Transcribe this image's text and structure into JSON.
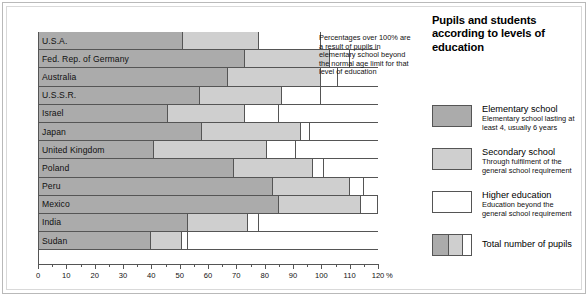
{
  "side": {
    "title": "Pupils and students according to levels of education",
    "legend": [
      {
        "name": "Elementary school",
        "desc": "Elementary school lasting at least 4, usually 6 years",
        "swatch": "elem",
        "color": "#ababab"
      },
      {
        "name": "Secondary school",
        "desc": "Through fulfilment of the general school requirement",
        "swatch": "sec",
        "color": "#cfcfcf"
      },
      {
        "name": "Higher education",
        "desc": "Education beyond the general school requirement",
        "swatch": "high",
        "color": "#ffffff"
      },
      {
        "name": "Total number of pupils",
        "desc": "",
        "swatch": "total",
        "color": "#ffffff"
      }
    ]
  },
  "annotation": "Percentages over 100% are a result of pupils in elementary school beyond the normal age limit for that level of education",
  "axis": {
    "unit": "%",
    "ticks": [
      0,
      10,
      20,
      30,
      40,
      50,
      60,
      70,
      80,
      90,
      100,
      110,
      120
    ]
  },
  "chart_data": {
    "type": "bar",
    "orientation": "horizontal",
    "stacked": true,
    "title": "Pupils and students according to levels of education",
    "xlabel": "%",
    "ylabel": "",
    "xlim": [
      0,
      120
    ],
    "grid": false,
    "legend_position": "right",
    "annotation": "Percentages over 100% are a result of pupils in elementary school beyond the normal age limit for that level of education",
    "categories": [
      "U.S.A.",
      "Fed. Rep. of Germany",
      "Australia",
      "U.S.S.R.",
      "Israel",
      "Japan",
      "United Kingdom",
      "Poland",
      "Peru",
      "Mexico",
      "India",
      "Sudan"
    ],
    "series": [
      {
        "name": "Elementary school",
        "color": "#ababab",
        "values": [
          51,
          73,
          67,
          57,
          46,
          58,
          41,
          69,
          83,
          85,
          53,
          40
        ]
      },
      {
        "name": "Secondary school",
        "color": "#cfcfcf",
        "values": [
          27,
          30,
          33,
          29,
          27,
          35,
          40,
          28,
          27,
          29,
          21,
          11
        ]
      },
      {
        "name": "Higher education",
        "color": "#ffffff",
        "values": [
          22,
          7,
          6,
          14,
          12,
          3,
          10,
          4,
          5,
          6,
          4,
          2
        ]
      }
    ],
    "totals": [
      100,
      110,
      106,
      100,
      85,
      96,
      91,
      101,
      115,
      120,
      78,
      53
    ]
  }
}
